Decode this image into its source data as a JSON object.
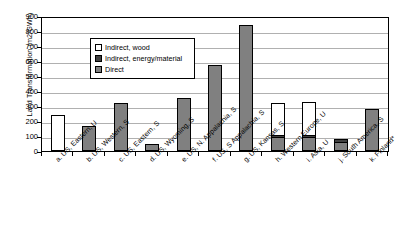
{
  "chart_data": {
    "type": "bar",
    "title": "",
    "xlabel": "",
    "ylabel": "Land Transformation (m2/GWh)",
    "ylim": [
      0,
      900
    ],
    "yticks": [
      900,
      800,
      700,
      600,
      500,
      400,
      300,
      200,
      100,
      0
    ],
    "grid": true,
    "stacked": true,
    "legend_position": "top-left inside plot",
    "categories": [
      "a. US, Eastern, U",
      "b. US, Western, S",
      "c. US, Eastern, S",
      "d. US, Wyoming, S",
      "e. US, N. Appalachia, S",
      "f. US, S Appalachia, S",
      "g. US, Kansas, S",
      "h. Western Europe, U",
      "i. Asia, U",
      "j. South America, S",
      "k. Finland*"
    ],
    "series": [
      {
        "name": "Indirect, wood",
        "color": "#ffffff",
        "values": [
          240,
          0,
          0,
          0,
          0,
          0,
          0,
          215,
          225,
          0,
          0
        ]
      },
      {
        "name": "Indirect, energy/material",
        "color": "#404040",
        "values": [
          0,
          0,
          0,
          0,
          0,
          0,
          0,
          10,
          10,
          20,
          0
        ]
      },
      {
        "name": "Direct",
        "color": "#808080",
        "values": [
          0,
          165,
          320,
          45,
          355,
          575,
          840,
          95,
          95,
          60,
          280
        ]
      }
    ],
    "totals": [
      240,
      165,
      320,
      45,
      355,
      575,
      840,
      320,
      330,
      80,
      280
    ],
    "legend": [
      {
        "label": "Indirect, wood",
        "swatch": "white-swatch"
      },
      {
        "label": "Indirect, energy/material",
        "swatch": "dark-gray-swatch"
      },
      {
        "label": "Direct",
        "swatch": "gray-swatch"
      }
    ]
  }
}
